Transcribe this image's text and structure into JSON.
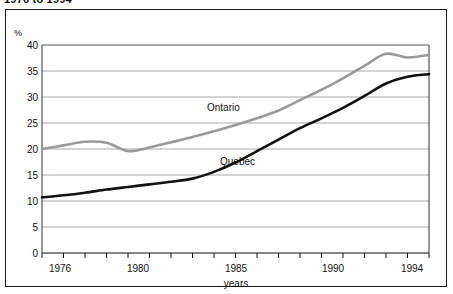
{
  "figure": {
    "headline": "1976 to 1994"
  },
  "axes": {
    "y_unit_label": "%",
    "y_ticks": [
      "0",
      "5",
      "10",
      "15",
      "20",
      "25",
      "30",
      "35",
      "40"
    ],
    "x_title": "years",
    "x_tick_labels": [
      "1976",
      "1980",
      "1985",
      "1990",
      "1994"
    ]
  },
  "series_labels": {
    "ontario": "Ontario",
    "quebec": "Quebec"
  },
  "colors": {
    "ontario_line": "#9a9a9a",
    "quebec_line": "#111111",
    "gridline": "#a8a8a8",
    "frame": "#1a1a1a",
    "background": "#ffffff"
  },
  "chart_data": {
    "type": "line",
    "title": "1976 to 1994",
    "xlabel": "years",
    "ylabel": "%",
    "xlim": [
      1976,
      1994
    ],
    "ylim": [
      0,
      40
    ],
    "grid": true,
    "legend": "inline-labels",
    "x": [
      1976,
      1977,
      1978,
      1979,
      1980,
      1981,
      1982,
      1983,
      1984,
      1985,
      1986,
      1987,
      1988,
      1989,
      1990,
      1991,
      1992,
      1993,
      1994
    ],
    "series": [
      {
        "name": "Ontario",
        "color": "#9a9a9a",
        "values": [
          20.0,
          20.7,
          21.4,
          21.2,
          19.6,
          20.3,
          21.3,
          22.3,
          23.4,
          24.6,
          25.9,
          27.4,
          29.4,
          31.4,
          33.6,
          36.0,
          38.3,
          37.6,
          38.1
        ]
      },
      {
        "name": "Quebec",
        "color": "#111111",
        "values": [
          10.7,
          11.1,
          11.6,
          12.2,
          12.7,
          13.2,
          13.7,
          14.3,
          15.6,
          17.4,
          19.6,
          21.8,
          24.0,
          25.9,
          27.9,
          30.2,
          32.6,
          33.9,
          34.4
        ]
      }
    ]
  }
}
